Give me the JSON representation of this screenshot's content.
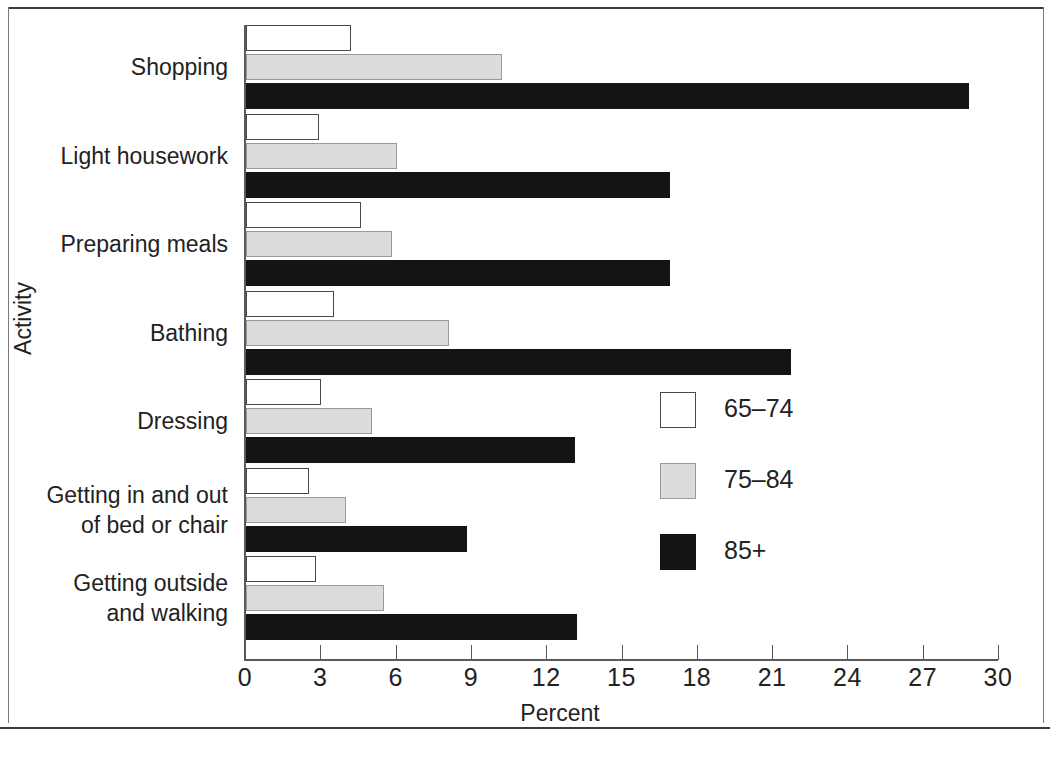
{
  "chart_data": {
    "type": "bar",
    "orientation": "horizontal",
    "title": "",
    "xlabel": "Percent",
    "ylabel": "Activity",
    "xlim": [
      0,
      30
    ],
    "xticks": [
      0,
      3,
      6,
      9,
      12,
      15,
      18,
      21,
      24,
      27,
      30
    ],
    "grid": false,
    "legend_position": "center-right",
    "categories": [
      "Shopping",
      "Light housework",
      "Preparing meals",
      "Bathing",
      "Dressing",
      "Getting in and out of bed or chair",
      "Getting outside and walking"
    ],
    "category_lines": [
      [
        "Shopping"
      ],
      [
        "Light housework"
      ],
      [
        "Preparing meals"
      ],
      [
        "Bathing"
      ],
      [
        "Dressing"
      ],
      [
        "Getting in and out",
        "of bed or chair"
      ],
      [
        "Getting outside",
        "and walking"
      ]
    ],
    "series": [
      {
        "name": "65–74",
        "color": "#ffffff",
        "edge_color": "#4a4a4a",
        "values": [
          4.2,
          2.9,
          4.6,
          3.5,
          3.0,
          2.5,
          2.8
        ]
      },
      {
        "name": "75–84",
        "color": "#dcdcdc",
        "edge_color": "#9a9a9a",
        "values": [
          10.2,
          6.0,
          5.8,
          8.1,
          5.0,
          4.0,
          5.5
        ]
      },
      {
        "name": "85+",
        "color": "#141414",
        "edge_color": "#141414",
        "values": [
          28.8,
          16.9,
          16.9,
          21.7,
          13.1,
          8.8,
          13.2
        ]
      }
    ]
  },
  "axes": {
    "x_title": "Percent",
    "y_title": "Activity",
    "x_tick_labels": [
      "0",
      "3",
      "6",
      "9",
      "12",
      "15",
      "18",
      "21",
      "24",
      "27",
      "30"
    ]
  },
  "legend": {
    "entries": [
      {
        "label": "65–74",
        "swatch": "white-square-swatch"
      },
      {
        "label": "75–84",
        "swatch": "gray-square-swatch"
      },
      {
        "label": "85+",
        "swatch": "black-square-swatch"
      }
    ]
  },
  "footer": {
    "source": ""
  }
}
